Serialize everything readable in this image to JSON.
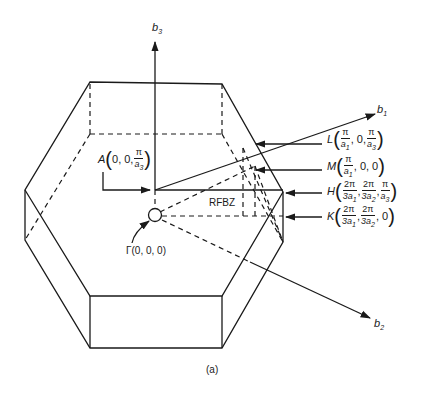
{
  "figure": {
    "caption": "(a)",
    "region_label": "RFBZ",
    "axes": {
      "b1": {
        "name": "b",
        "sub": "1"
      },
      "b2": {
        "name": "b",
        "sub": "2"
      },
      "b3": {
        "name": "b",
        "sub": "3"
      }
    },
    "points": {
      "gamma": {
        "letter": "Γ",
        "coords": "(0, 0, 0)"
      },
      "A": {
        "letter": "A",
        "c1": "0, 0,",
        "num3": "π",
        "den3": "a",
        "den3_sub": "3"
      },
      "L": {
        "letter": "L",
        "num1": "π",
        "den1": "a",
        "den1_sub": "1",
        "mid": ", 0, ",
        "num3": "π",
        "den3": "a",
        "den3_sub": "3"
      },
      "M": {
        "letter": "M",
        "num1": "π",
        "den1": "a",
        "den1_sub": "1",
        "rest": ", 0, 0"
      },
      "H": {
        "letter": "H",
        "num1": "2π",
        "den1": "3a",
        "den1_sub": "1",
        "num2": "2π",
        "den2": "3a",
        "den2_sub": "2",
        "num3": "π",
        "den3": "a",
        "den3_sub": "3"
      },
      "K": {
        "letter": "K",
        "num1": "2π",
        "den1": "3a",
        "den1_sub": "1",
        "num2": "2π",
        "den2": "3a",
        "den2_sub": "2",
        "rest": ", 0"
      }
    },
    "colors": {
      "line": "#1a1a1a",
      "background": "#ffffff"
    }
  }
}
